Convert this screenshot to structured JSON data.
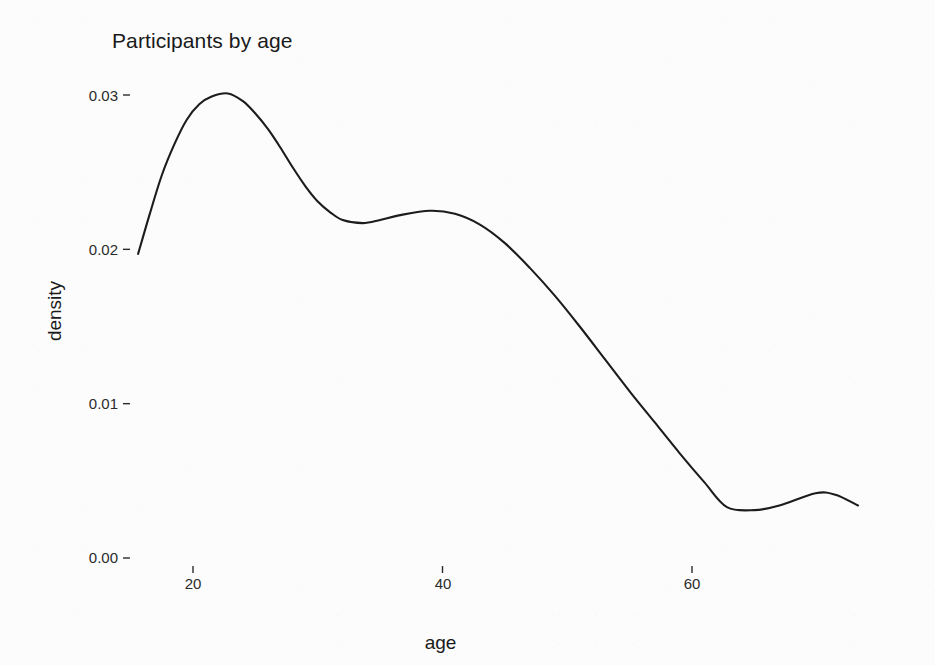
{
  "chart_data": {
    "type": "line",
    "title": "Participants by age",
    "subtitle": "",
    "xlabel": "age",
    "ylabel": "density",
    "grid": false,
    "legend": false,
    "legend_position": "none",
    "xlim": [
      14.0,
      75.5
    ],
    "ylim": [
      0.0,
      0.0315
    ],
    "xticks": [
      20,
      40,
      60
    ],
    "xtick_labels": [
      "20",
      "40",
      "60"
    ],
    "yticks": [
      0.0,
      0.01,
      0.02,
      0.03
    ],
    "ytick_labels": [
      "0.00",
      "0.01",
      "0.02",
      "0.03"
    ],
    "line_color": "#1c1c1c",
    "series": [
      {
        "name": "density",
        "x": [
          15.6,
          16.5,
          17.5,
          18.5,
          19.5,
          20.5,
          21.5,
          22.8,
          24.0,
          25.0,
          26.0,
          27.0,
          28.0,
          29.0,
          30.0,
          31.0,
          32.0,
          33.6,
          35.0,
          36.5,
          39.0,
          41.0,
          43.0,
          45.0,
          47.0,
          49.0,
          51.0,
          53.0,
          55.0,
          57.0,
          59.0,
          61.0,
          62.8,
          65.0,
          67.0,
          69.9,
          71.5,
          73.3
        ],
        "y": [
          0.0197,
          0.0222,
          0.0248,
          0.0268,
          0.0284,
          0.0294,
          0.0299,
          0.0301,
          0.0296,
          0.0288,
          0.0278,
          0.0266,
          0.0253,
          0.0241,
          0.0231,
          0.0224,
          0.0219,
          0.0217,
          0.0219,
          0.0222,
          0.0225,
          0.0223,
          0.0216,
          0.0204,
          0.0188,
          0.017,
          0.015,
          0.0129,
          0.0108,
          0.0088,
          0.0068,
          0.0049,
          0.0033,
          0.0031,
          0.0034,
          0.0042,
          0.0041,
          0.0034
        ],
        "peaks": [
          {
            "label": "primary mode",
            "x": 22.8,
            "y": 0.0301
          },
          {
            "label": "secondary mode",
            "x": 39.0,
            "y": 0.0225
          },
          {
            "label": "tertiary bump",
            "x": 69.9,
            "y": 0.0042
          }
        ],
        "troughs": [
          {
            "label": "mid dip",
            "x": 33.6,
            "y": 0.0217
          },
          {
            "label": "late dip",
            "x": 62.8,
            "y": 0.0031
          }
        ]
      }
    ]
  },
  "figure": {
    "title": "Participants by age",
    "x_axis_title": "age",
    "y_axis_title": "density",
    "x_tick_labels": [
      "20",
      "40",
      "60"
    ],
    "y_tick_labels": [
      "0.03",
      "0.02",
      "0.01",
      "0.00"
    ]
  }
}
